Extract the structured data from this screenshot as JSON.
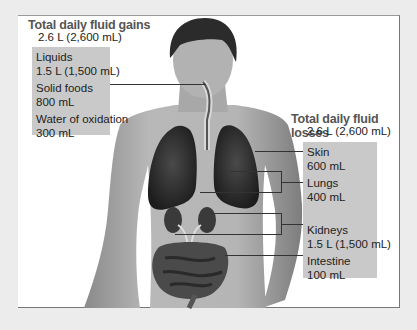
{
  "gains": {
    "title": "Total daily fluid gains",
    "total": "2.6 L (2,600 mL)",
    "items": [
      {
        "label": "Liquids",
        "value": "1.5 L (1,500 mL)"
      },
      {
        "label": "Solid foods",
        "value": "800 mL"
      },
      {
        "label": "Water of oxidation",
        "value": "300 mL"
      }
    ]
  },
  "losses": {
    "title": "Total daily fluid losses",
    "total": "2.6 L (2,600 mL)",
    "items": [
      {
        "label": "Skin",
        "value": "600 mL"
      },
      {
        "label": "Lungs",
        "value": "400 mL"
      },
      {
        "label": "Kidneys",
        "value": "1.5 L (1,500 mL)"
      },
      {
        "label": "Intestine",
        "value": "100 mL"
      }
    ]
  },
  "colors": {
    "background": "#ececec",
    "panel": "#ffffff",
    "label_box": "#c9c9c9",
    "title": "#555555"
  }
}
